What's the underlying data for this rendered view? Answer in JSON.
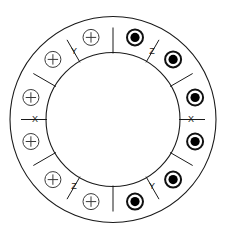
{
  "diagram": {
    "type": "machine-cross-section",
    "background_color": "#ffffff",
    "line_color": "#1a1a1a",
    "conductor_fill_color": "#000000",
    "geometry": {
      "center_x": 113,
      "center_y": 119.5,
      "outer_radius": 103,
      "inner_radius": 67,
      "conductor_orbit_radius": 85,
      "conductor_radius": 9,
      "dot_radius": 4.6,
      "label_orbit_radius": 78
    },
    "outer_circle": {
      "name": "stator-frame",
      "radius": 103
    },
    "inner_circle": {
      "name": "rotor-bore",
      "radius": 67
    },
    "conductors": [
      {
        "id": "c1",
        "angle_deg": 75,
        "symbol": "dot",
        "meaning": "current-out-of-page"
      },
      {
        "id": "c2",
        "angle_deg": 105,
        "symbol": "plus",
        "meaning": "current-into-page"
      },
      {
        "id": "c3",
        "angle_deg": 135,
        "symbol": "plus",
        "meaning": "current-into-page"
      },
      {
        "id": "c4",
        "angle_deg": 165,
        "symbol": "plus",
        "meaning": "current-into-page"
      },
      {
        "id": "c5",
        "angle_deg": 195,
        "symbol": "plus",
        "meaning": "current-into-page"
      },
      {
        "id": "c6",
        "angle_deg": 225,
        "symbol": "plus",
        "meaning": "current-into-page"
      },
      {
        "id": "c7",
        "angle_deg": 255,
        "symbol": "plus",
        "meaning": "current-into-page"
      },
      {
        "id": "c8",
        "angle_deg": 285,
        "symbol": "dot",
        "meaning": "current-out-of-page"
      },
      {
        "id": "c9",
        "angle_deg": 315,
        "symbol": "dot",
        "meaning": "current-out-of-page"
      },
      {
        "id": "c10",
        "angle_deg": 345,
        "symbol": "dot",
        "meaning": "current-out-of-page"
      },
      {
        "id": "c11",
        "angle_deg": 15,
        "symbol": "dot",
        "meaning": "current-out-of-page"
      },
      {
        "id": "c12",
        "angle_deg": 45,
        "symbol": "dot",
        "meaning": "current-out-of-page"
      }
    ],
    "labels": [
      {
        "id": "l1",
        "text": "Z",
        "angle_deg": 60,
        "phase": "Z",
        "side": "top-left"
      },
      {
        "id": "l2",
        "text": "Y",
        "angle_deg": 120,
        "phase": "Y",
        "side": "top-right"
      },
      {
        "id": "l3",
        "text": "X",
        "angle_deg": 180,
        "phase": "X",
        "side": "right"
      },
      {
        "id": "l4",
        "text": "Z",
        "angle_deg": 240,
        "phase": "Z",
        "side": "bottom-right"
      },
      {
        "id": "l5",
        "text": "Y",
        "angle_deg": 300,
        "phase": "Y",
        "side": "bottom-left"
      },
      {
        "id": "l6",
        "text": "X",
        "angle_deg": 0,
        "phase": "X",
        "side": "left"
      }
    ],
    "legend": {
      "dot_label": "Z",
      "plus_label": "Y",
      "dot_meaning": "current out of page",
      "plus_meaning": "current into page"
    }
  }
}
